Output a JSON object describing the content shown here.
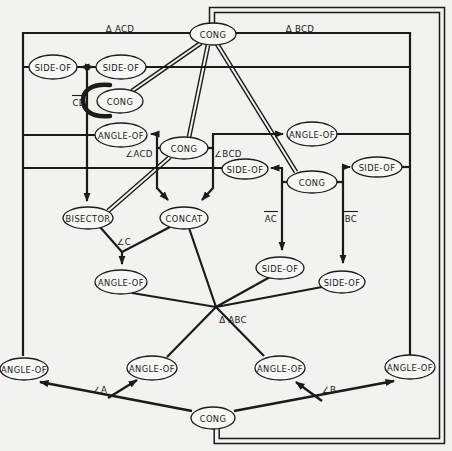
{
  "figure": {
    "description_colors": {
      "ink": "#1b1b1b",
      "paper": "#f2f2ef",
      "node_fill": "#f7f7f4"
    },
    "nodes": [
      {
        "id": "cong-top",
        "label": "CONG",
        "x": 213,
        "y": 34,
        "rx": 23,
        "ry": 11
      },
      {
        "id": "side-of-1",
        "label": "SIDE-OF",
        "x": 53,
        "y": 67,
        "rx": 24,
        "ry": 12
      },
      {
        "id": "side-of-2",
        "label": "SIDE-OF",
        "x": 121,
        "y": 67,
        "rx": 25,
        "ry": 12
      },
      {
        "id": "cong-cd",
        "label": "CONG",
        "x": 120,
        "y": 101,
        "rx": 23,
        "ry": 12
      },
      {
        "id": "angle-of-left",
        "label": "ANGLE-OF",
        "x": 121,
        "y": 135,
        "rx": 26,
        "ry": 12
      },
      {
        "id": "cong-mid",
        "label": "CONG",
        "x": 184,
        "y": 148,
        "rx": 24,
        "ry": 11
      },
      {
        "id": "side-of-bcd",
        "label": "SIDE-OF",
        "x": 245,
        "y": 169,
        "rx": 23,
        "ry": 10
      },
      {
        "id": "cong-right",
        "label": "CONG",
        "x": 312,
        "y": 182,
        "rx": 25,
        "ry": 11
      },
      {
        "id": "side-of-right",
        "label": "SIDE-OF",
        "x": 377,
        "y": 167,
        "rx": 25,
        "ry": 10
      },
      {
        "id": "angle-of-right",
        "label": "ANGLE-OF",
        "x": 312,
        "y": 134,
        "rx": 25,
        "ry": 12
      },
      {
        "id": "bisector",
        "label": "BISECTOR",
        "x": 88,
        "y": 218,
        "rx": 25,
        "ry": 11
      },
      {
        "id": "concat",
        "label": "CONCAT",
        "x": 184,
        "y": 218,
        "rx": 24,
        "ry": 11
      },
      {
        "id": "side-of-ac",
        "label": "SIDE-OF",
        "x": 280,
        "y": 268,
        "rx": 24,
        "ry": 11
      },
      {
        "id": "side-of-bc",
        "label": "SIDE-OF",
        "x": 342,
        "y": 282,
        "rx": 23,
        "ry": 11
      },
      {
        "id": "angle-of-c",
        "label": "ANGLE-OF",
        "x": 121,
        "y": 282,
        "rx": 26,
        "ry": 12
      },
      {
        "id": "angle-of-far-left",
        "label": "ANGLE-OF",
        "x": 24,
        "y": 369,
        "rx": 24,
        "ry": 11
      },
      {
        "id": "angle-of-a",
        "label": "ANGLE-OF",
        "x": 152,
        "y": 368,
        "rx": 25,
        "ry": 12
      },
      {
        "id": "angle-of-b",
        "label": "ANGLE-OF",
        "x": 280,
        "y": 368,
        "rx": 25,
        "ry": 12
      },
      {
        "id": "angle-of-far-right",
        "label": "ANGLE-OF",
        "x": 410,
        "y": 367,
        "rx": 25,
        "ry": 12
      },
      {
        "id": "cong-bottom",
        "label": "CONG",
        "x": 213,
        "y": 418,
        "rx": 22,
        "ry": 11
      }
    ],
    "edge_labels": [
      {
        "id": "tri-acd",
        "text": "Δ ACD",
        "x": 120,
        "y": 28,
        "overline": false
      },
      {
        "id": "tri-bcd",
        "text": "Δ BCD",
        "x": 300,
        "y": 28,
        "overline": false
      },
      {
        "id": "seg-cd",
        "text": "CD",
        "x": 79,
        "y": 102,
        "overline": true
      },
      {
        "id": "ang-acd",
        "text": "∠ACD",
        "x": 139,
        "y": 153,
        "overline": false
      },
      {
        "id": "ang-bcd",
        "text": "∠BCD",
        "x": 228,
        "y": 153,
        "overline": false
      },
      {
        "id": "seg-ac",
        "text": "AC",
        "x": 271,
        "y": 218,
        "overline": true
      },
      {
        "id": "seg-bc",
        "text": "BC",
        "x": 351,
        "y": 218,
        "overline": true
      },
      {
        "id": "ang-c",
        "text": "∠C",
        "x": 124,
        "y": 241,
        "overline": false
      },
      {
        "id": "tri-abc",
        "text": "Δ ABC",
        "x": 233,
        "y": 319,
        "overline": false
      },
      {
        "id": "ang-a",
        "text": "∠A",
        "x": 100,
        "y": 389,
        "overline": false
      },
      {
        "id": "ang-b",
        "text": "∠B",
        "x": 329,
        "y": 389,
        "overline": false
      }
    ],
    "lines": [
      {
        "id": "outer-frame",
        "pts": [
          [
            23,
            356
          ],
          [
            23,
            33
          ],
          [
            410,
            33
          ],
          [
            410,
            355
          ]
        ],
        "arrows": "none",
        "w": 2.2,
        "double": false
      },
      {
        "id": "side-row",
        "pts": [
          [
            23,
            67
          ],
          [
            410,
            67
          ]
        ],
        "arrows": "none",
        "w": 2.2,
        "double": false
      },
      {
        "id": "side-swap-arrows",
        "pts": [
          [
            81,
            67
          ],
          [
            93,
            67
          ]
        ],
        "arrows": "both",
        "w": 2.2,
        "double": false
      },
      {
        "id": "bisector-drop",
        "pts": [
          [
            87,
            67
          ],
          [
            87,
            201
          ]
        ],
        "arrows": "end",
        "w": 2.2,
        "double": false
      },
      {
        "id": "angle-left-row",
        "pts": [
          [
            23,
            135
          ],
          [
            95,
            135
          ]
        ],
        "arrows": "none",
        "w": 2.2,
        "double": false
      },
      {
        "id": "congmid-left-bracket",
        "pts": [
          [
            151,
            134
          ],
          [
            157,
            134
          ],
          [
            157,
            188
          ],
          [
            168,
            200
          ]
        ],
        "arrows": "both",
        "w": 2.2,
        "double": false
      },
      {
        "id": "congmid-right-bracket",
        "pts": [
          [
            283,
            134
          ],
          [
            213,
            134
          ],
          [
            213,
            188
          ],
          [
            202,
            200
          ]
        ],
        "arrows": "both",
        "w": 2.2,
        "double": false
      },
      {
        "id": "congmid-left-tie",
        "pts": [
          [
            157,
            148
          ],
          [
            166,
            148
          ]
        ],
        "arrows": "none",
        "w": 2.2,
        "double": false
      },
      {
        "id": "congmid-right-tie",
        "pts": [
          [
            202,
            148
          ],
          [
            213,
            148
          ]
        ],
        "arrows": "none",
        "w": 2.2,
        "double": false
      },
      {
        "id": "angle-right-row",
        "pts": [
          [
            337,
            134
          ],
          [
            410,
            134
          ]
        ],
        "arrows": "none",
        "w": 2.2,
        "double": false
      },
      {
        "id": "long-168-row",
        "pts": [
          [
            23,
            168
          ],
          [
            224,
            168
          ]
        ],
        "arrows": "none",
        "w": 2.2,
        "double": false
      },
      {
        "id": "sideright-tie",
        "pts": [
          [
            402,
            167
          ],
          [
            410,
            167
          ]
        ],
        "arrows": "none",
        "w": 2.2,
        "double": false
      },
      {
        "id": "congright-left-bracket",
        "pts": [
          [
            271,
            168
          ],
          [
            282,
            168
          ],
          [
            282,
            250
          ]
        ],
        "arrows": "both",
        "w": 2.2,
        "double": false
      },
      {
        "id": "congright-left-tie",
        "pts": [
          [
            282,
            182
          ],
          [
            291,
            182
          ]
        ],
        "arrows": "none",
        "w": 2.2,
        "double": false
      },
      {
        "id": "congright-right-bracket",
        "pts": [
          [
            350,
            167
          ],
          [
            343,
            167
          ],
          [
            343,
            263
          ]
        ],
        "arrows": "both",
        "w": 2.2,
        "double": false
      },
      {
        "id": "congright-right-tie",
        "pts": [
          [
            334,
            182
          ],
          [
            343,
            182
          ]
        ],
        "arrows": "none",
        "w": 2.2,
        "double": false
      },
      {
        "id": "bisector-to-anglec",
        "pts": [
          [
            100,
            227
          ],
          [
            122,
            252
          ]
        ],
        "arrows": "none",
        "w": 2.2,
        "double": false
      },
      {
        "id": "concat-to-anglec",
        "pts": [
          [
            170,
            227
          ],
          [
            122,
            252
          ]
        ],
        "arrows": "none",
        "w": 2.2,
        "double": false
      },
      {
        "id": "anglec-arrow",
        "pts": [
          [
            122,
            252
          ],
          [
            122,
            264
          ]
        ],
        "arrows": "end",
        "w": 2.2,
        "double": false
      },
      {
        "id": "anglec-to-junction",
        "pts": [
          [
            132,
            293
          ],
          [
            216,
            307
          ]
        ],
        "arrows": "none",
        "w": 2.2,
        "double": false
      },
      {
        "id": "concat-to-junction",
        "pts": [
          [
            189,
            228
          ],
          [
            216,
            307
          ]
        ],
        "arrows": "none",
        "w": 2.2,
        "double": false
      },
      {
        "id": "sideac-to-junction",
        "pts": [
          [
            270,
            277
          ],
          [
            216,
            307
          ]
        ],
        "arrows": "none",
        "w": 2.2,
        "double": false
      },
      {
        "id": "sidebc-to-junction",
        "pts": [
          [
            322,
            287
          ],
          [
            216,
            307
          ]
        ],
        "arrows": "none",
        "w": 2.2,
        "double": false
      },
      {
        "id": "junction-to-anglea",
        "pts": [
          [
            216,
            307
          ],
          [
            167,
            357
          ]
        ],
        "arrows": "none",
        "w": 2.2,
        "double": false
      },
      {
        "id": "junction-to-angleb",
        "pts": [
          [
            216,
            307
          ],
          [
            264,
            356
          ]
        ],
        "arrows": "none",
        "w": 2.2,
        "double": false
      },
      {
        "id": "congbottom-to-farleft",
        "pts": [
          [
            192,
            411
          ],
          [
            40,
            382
          ]
        ],
        "arrows": "end",
        "w": 2.4,
        "double": false
      },
      {
        "id": "congbottom-branch-a",
        "pts": [
          [
            108,
            398
          ],
          [
            137,
            380
          ]
        ],
        "arrows": "end",
        "w": 2.4,
        "double": false
      },
      {
        "id": "congbottom-to-farright",
        "pts": [
          [
            234,
            411
          ],
          [
            394,
            381
          ]
        ],
        "arrows": "end",
        "w": 2.4,
        "double": false
      },
      {
        "id": "congbottom-branch-b",
        "pts": [
          [
            322,
            401
          ],
          [
            296,
            382
          ]
        ],
        "arrows": "end",
        "w": 2.4,
        "double": false
      },
      {
        "id": "congtop-to-congcd",
        "pts": [
          [
            201,
            43
          ],
          [
            132,
            91
          ]
        ],
        "arrows": "none",
        "w": 1.4,
        "double": true
      },
      {
        "id": "congtop-to-congmid",
        "pts": [
          [
            208,
            45
          ],
          [
            189,
            137
          ]
        ],
        "arrows": "none",
        "w": 1.4,
        "double": true
      },
      {
        "id": "congtop-to-congright",
        "pts": [
          [
            217,
            44
          ],
          [
            296,
            172
          ]
        ],
        "arrows": "none",
        "w": 1.4,
        "double": true
      },
      {
        "id": "congmid-to-bisector",
        "pts": [
          [
            170,
            157
          ],
          [
            108,
            211
          ]
        ],
        "arrows": "none",
        "w": 1.4,
        "double": true
      },
      {
        "id": "cong-loop-outer",
        "pts": [
          [
            209.5,
            25
          ],
          [
            209.5,
            7.5
          ],
          [
            444.5,
            7.5
          ],
          [
            444.5,
            443.5
          ],
          [
            214.2,
            443.5
          ],
          [
            214.2,
            428
          ]
        ],
        "arrows": "none",
        "w": 1.5,
        "double": false
      },
      {
        "id": "cong-loop-inner",
        "pts": [
          [
            214.5,
            25
          ],
          [
            214.5,
            12.5
          ],
          [
            439.5,
            12.5
          ],
          [
            439.5,
            438.5
          ],
          [
            219.2,
            438.5
          ],
          [
            219.2,
            428
          ]
        ],
        "arrows": "none",
        "w": 1.5,
        "double": false
      }
    ],
    "arcs": [
      {
        "id": "cd-arc",
        "d": "M 110,85 C 90,83 83,92 83,100 C 83,109 90,118 110,116",
        "w": 4.5
      }
    ]
  }
}
